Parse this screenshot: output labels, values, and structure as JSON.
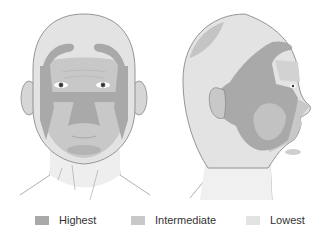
{
  "figure": {
    "views": [
      {
        "name": "Frontal view"
      },
      {
        "name": "Lateral view"
      }
    ],
    "colors": {
      "highest": "#a9a9a9",
      "intermediate": "#c8c8c8",
      "lowest": "#e3e3e3",
      "outline": "#8a8a8a",
      "background": "#ffffff"
    }
  },
  "legend": {
    "items": [
      {
        "label": "Highest",
        "color": "#a9a9a9"
      },
      {
        "label": "Intermediate",
        "color": "#c8c8c8"
      },
      {
        "label": "Lowest",
        "color": "#e3e3e3"
      }
    ]
  }
}
